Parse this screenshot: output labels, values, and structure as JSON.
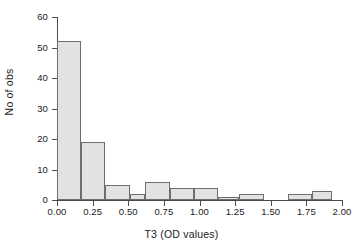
{
  "chart_data": {
    "type": "bar",
    "title": "",
    "subtitle": "",
    "xlabel": "T3 (OD values)",
    "ylabel": "No of obs",
    "xlim": [
      0.0,
      2.0
    ],
    "ylim": [
      0,
      60
    ],
    "xticks": [
      0.0,
      0.25,
      0.5,
      0.75,
      1.0,
      1.25,
      1.5,
      1.75,
      2.0
    ],
    "xtick_labels": [
      "0.00",
      "0.25",
      "0.50",
      "0.75",
      "1.00",
      "1.25",
      "1.50",
      "1.75",
      "2.00"
    ],
    "yticks": [
      0,
      10,
      20,
      30,
      40,
      50,
      60
    ],
    "ytick_labels": [
      "0",
      "10",
      "20",
      "30",
      "40",
      "50",
      "60"
    ],
    "grid": false,
    "legend": null,
    "bin_width": 0.17,
    "bars": [
      {
        "x0": 0.0,
        "x1": 0.17,
        "value": 52
      },
      {
        "x0": 0.17,
        "x1": 0.34,
        "value": 19
      },
      {
        "x0": 0.34,
        "x1": 0.51,
        "value": 5
      },
      {
        "x0": 0.51,
        "x1": 0.62,
        "value": 2
      },
      {
        "x0": 0.62,
        "x1": 0.79,
        "value": 6
      },
      {
        "x0": 0.79,
        "x1": 0.96,
        "value": 4
      },
      {
        "x0": 0.96,
        "x1": 1.13,
        "value": 4
      },
      {
        "x0": 1.13,
        "x1": 1.28,
        "value": 1
      },
      {
        "x0": 1.28,
        "x1": 1.45,
        "value": 2
      },
      {
        "x0": 1.62,
        "x1": 1.79,
        "value": 2
      },
      {
        "x0": 1.79,
        "x1": 1.93,
        "value": 3
      }
    ],
    "colors": {
      "bar_fill": "#e2e2e2",
      "bar_edge": "#6e6e6e",
      "axis": "#4d4d4d",
      "background": "#ffffff",
      "text": "#1a1a1a"
    }
  }
}
